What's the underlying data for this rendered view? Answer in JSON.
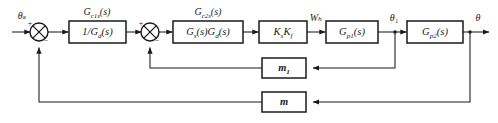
{
  "diagram": {
    "type": "control-system-block-diagram",
    "signals": {
      "input": "θₛ",
      "mid_wb": "Wₕ",
      "theta1": "θ₁",
      "output": "θ"
    },
    "sum_junctions": [
      {
        "name": "sum-1",
        "plus": "+",
        "minus": "−"
      },
      {
        "name": "sum-2",
        "plus": "+",
        "minus": "−"
      }
    ],
    "blocks": [
      {
        "id": "block-inv-gd",
        "over_label": "G",
        "over_sub": "c1s",
        "over_tail": "(s)",
        "content_pre": "1/G",
        "content_sub": "d",
        "content_tail": "(s)"
      },
      {
        "id": "block-gs-gd",
        "over_label": "G",
        "over_sub": "c2s",
        "over_tail": "(s)",
        "content_pre": "G",
        "content_sub": "s",
        "content_mid": "(s)G",
        "content_sub2": "d",
        "content_tail": "(s)"
      },
      {
        "id": "block-ksKf",
        "content_pre": "K",
        "content_sub": "s",
        "content_mid": "K",
        "content_sub2": "f"
      },
      {
        "id": "block-gp1",
        "content_pre": "G",
        "content_sub": "p1",
        "content_tail": "(s)"
      },
      {
        "id": "block-gp2",
        "content_pre": "G",
        "content_sub": "p2",
        "content_tail": "(s)"
      }
    ],
    "feedback": [
      {
        "id": "feedback-m1",
        "label": "m",
        "sub": "1"
      },
      {
        "id": "feedback-m",
        "label": "m",
        "sub": ""
      }
    ],
    "colors": {
      "line": "#1a1a1a",
      "background": "#ffffff"
    }
  }
}
